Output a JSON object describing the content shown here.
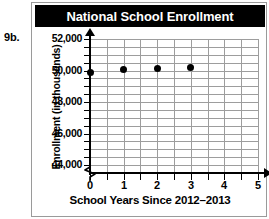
{
  "problem": {
    "number_label": "9b."
  },
  "chart_data": {
    "type": "scatter",
    "title": "National School Enrollment",
    "xlabel": "School Years Since 2012–2013",
    "ylabel": "Enrollment (in thousands)",
    "x": [
      0,
      1,
      2,
      3
    ],
    "values": [
      49900,
      50050,
      50100,
      50200
    ],
    "points": [
      {
        "x": 0,
        "y": 49900
      },
      {
        "x": 1,
        "y": 50050
      },
      {
        "x": 2,
        "y": 50100
      },
      {
        "x": 3,
        "y": 50200
      }
    ],
    "xlim": [
      0,
      5
    ],
    "ylim": [
      43500,
      52000
    ],
    "y_axis_break": true,
    "y_axis_break_symbol": "zigzag",
    "xticks": [
      0,
      1,
      2,
      3,
      4,
      5
    ],
    "xtick_labels": [
      "0",
      "1",
      "2",
      "3",
      "4",
      "5"
    ],
    "x_minor_tick_step": 0.5,
    "yticks": [
      44000,
      46000,
      48000,
      50000,
      52000
    ],
    "ytick_labels": [
      "44,000",
      "46,000",
      "48,000",
      "50,000",
      "52,000"
    ],
    "y_minor_tick_step": 500,
    "grid": true,
    "grid_x_step": 0.5,
    "grid_y_step": 500,
    "legend": null,
    "colors": {
      "title_bar_background": "#000000",
      "title_text": "#ffffff",
      "grid": "#9d9d9d",
      "axis": "#000000",
      "marker": "#000000",
      "plot_background": "#ffffff",
      "card_border": "#9a9a9a"
    }
  }
}
